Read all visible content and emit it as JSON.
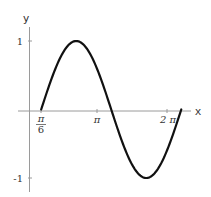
{
  "chart_data": {
    "type": "line",
    "title": "",
    "function": "sin(x - π/6)",
    "xlabel": "x",
    "ylabel": "y",
    "xlim": [
      0.5236,
      6.8068
    ],
    "ylim": [
      -1,
      1
    ],
    "grid": false,
    "legend": null,
    "x_ticks": [
      {
        "value": 0.5236,
        "label_num": "π",
        "label_den": "6"
      },
      {
        "value": 3.1416,
        "label": "π"
      },
      {
        "value": 6.2832,
        "label": "2 π"
      }
    ],
    "y_ticks": [
      {
        "value": 1,
        "label": "1"
      },
      {
        "value": -1,
        "label": "-1"
      }
    ],
    "series": [
      {
        "name": "sin(x - π/6)",
        "color": "#111111",
        "x": [
          0.5236,
          1.0472,
          1.5708,
          2.0944,
          2.618,
          3.1416,
          3.6652,
          4.1888,
          4.7124,
          5.236,
          5.7596,
          6.2832,
          6.8068
        ],
        "y": [
          0,
          0.5,
          0.866,
          1,
          0.866,
          0.5,
          0,
          -0.5,
          -0.866,
          -1,
          -0.866,
          -0.5,
          0
        ]
      }
    ]
  },
  "axes": {
    "x_label": "x",
    "y_label": "y",
    "tick_pi_over_6_num": "π",
    "tick_pi_over_6_den": "6",
    "tick_pi": "π",
    "tick_2pi": "2 π",
    "tick_y_pos1": "1",
    "tick_y_neg1": "-1"
  },
  "colors": {
    "curve": "#111111",
    "axis": "#9a9a9a",
    "text": "#333333"
  }
}
